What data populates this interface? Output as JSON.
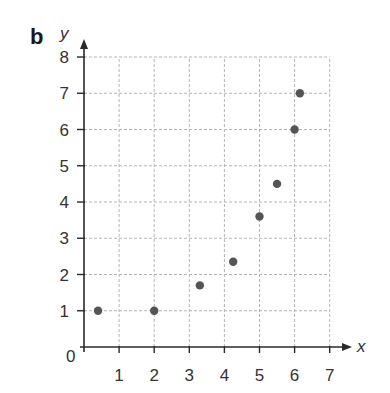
{
  "panel_label": "b",
  "chart_data": {
    "type": "scatter",
    "title": "",
    "xlabel": "x",
    "ylabel": "y",
    "xlim": [
      0,
      7
    ],
    "ylim": [
      0,
      8
    ],
    "x_ticks": [
      1,
      2,
      3,
      4,
      5,
      6,
      7
    ],
    "y_ticks": [
      1,
      2,
      3,
      4,
      5,
      6,
      7,
      8
    ],
    "origin_label": "0",
    "grid": true,
    "series": [
      {
        "name": "points",
        "color": "#555555",
        "points": [
          {
            "x": 0.4,
            "y": 1.0
          },
          {
            "x": 2.0,
            "y": 1.0
          },
          {
            "x": 3.3,
            "y": 1.7
          },
          {
            "x": 4.25,
            "y": 2.35
          },
          {
            "x": 5.0,
            "y": 3.6
          },
          {
            "x": 5.5,
            "y": 4.5
          },
          {
            "x": 6.0,
            "y": 6.0
          },
          {
            "x": 6.15,
            "y": 7.0
          }
        ]
      }
    ]
  }
}
